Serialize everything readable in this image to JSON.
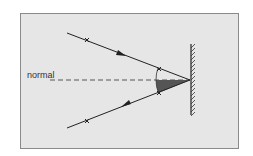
{
  "diagram": {
    "type": "law-of-reflection",
    "normal_label": "normal",
    "colors": {
      "background": "#e6e6e6",
      "border": "#8a8a8a",
      "ray": "#222222",
      "angle_fill": "#555555"
    },
    "elements": [
      "incident-ray",
      "reflected-ray",
      "normal-line",
      "plane-mirror",
      "angle-of-incidence-arc",
      "angle-of-reflection-shaded"
    ]
  }
}
